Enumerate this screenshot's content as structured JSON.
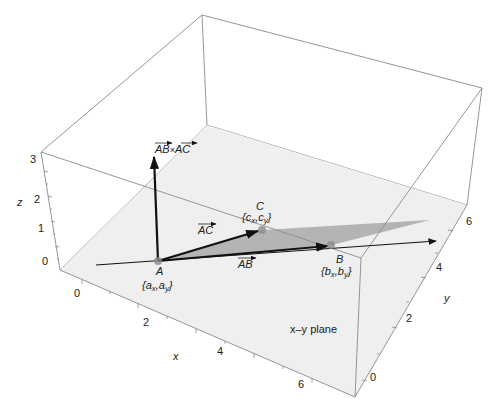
{
  "figure": {
    "axes": {
      "x": {
        "label": "x",
        "ticks": [
          "0",
          "2",
          "4",
          "6"
        ]
      },
      "y": {
        "label": "y",
        "ticks": [
          "0",
          "2",
          "4",
          "6"
        ]
      },
      "z": {
        "label": "z",
        "ticks": [
          "0",
          "1",
          "2",
          "3"
        ]
      }
    },
    "plane_label": "x–y plane",
    "points": {
      "A": {
        "name": "A",
        "coords": "{a",
        "sub1": "x",
        "sep": ",a",
        "sub2": "y",
        "close": "}"
      },
      "B": {
        "name": "B",
        "coords": "{b",
        "sub1": "x",
        "sep": ",b",
        "sub2": "y",
        "close": "}"
      },
      "C": {
        "name": "C",
        "coords": "{c",
        "sub1": "x",
        "sep": ",c",
        "sub2": "y",
        "close": "}"
      }
    },
    "vectors": {
      "AB": "AB",
      "AC": "AC",
      "cross_left": "AB",
      "cross_op": "×",
      "cross_right": "AC"
    },
    "colors": {
      "plane": "#efefef",
      "triangle": "#a9a9a9",
      "box_edge": "#8a8a8a",
      "vector": "#111111",
      "point": "#8c8c8c"
    }
  }
}
